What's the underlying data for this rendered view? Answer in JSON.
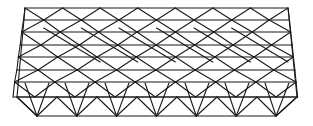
{
  "diagram": {
    "type": "space-frame-truss-wireframe",
    "stroke_color": "#1a1a1a",
    "background": "#ffffff",
    "bays": 7,
    "layers": 4,
    "top_left": [
      25,
      8
    ],
    "top_right": [
      288,
      8
    ],
    "bottom_left": [
      17,
      97
    ],
    "bottom_right": [
      297,
      97
    ],
    "front_bottom_left": [
      37,
      116
    ],
    "front_bottom_right": [
      276,
      116
    ],
    "layer_y_top": [
      8,
      32,
      57,
      82
    ],
    "layer_y_bottom": [
      20,
      45,
      70,
      97
    ],
    "layer_shift_x": [
      0,
      -2.5,
      -5,
      -8
    ]
  }
}
